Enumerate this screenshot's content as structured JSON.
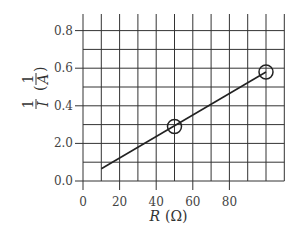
{
  "chart_data": {
    "type": "line",
    "title": "",
    "xlabel": "R (Ω)",
    "ylabel": "1/I (1/A)",
    "x_ticks": [
      "0",
      "20",
      "40",
      "60",
      "80"
    ],
    "y_ticks": [
      "0.0",
      "2.0",
      "0.4",
      "0.6",
      "0.8"
    ],
    "xlim": [
      0,
      110
    ],
    "ylim": [
      0,
      0.9
    ],
    "grid": true,
    "legend": null,
    "series": [
      {
        "name": "best-fit line",
        "x": [
          10,
          100
        ],
        "y": [
          0.065,
          0.58
        ]
      }
    ],
    "marked_points": [
      {
        "x": 50,
        "y": 0.29,
        "marker": "circle"
      },
      {
        "x": 100,
        "y": 0.58,
        "marker": "circle"
      }
    ]
  },
  "axes": {
    "x_label_var": "R",
    "x_label_unit": "(Ω)",
    "y_label_num": "1",
    "y_label_den": "I",
    "y_label_unit_num": "1",
    "y_label_unit_den": "A"
  }
}
